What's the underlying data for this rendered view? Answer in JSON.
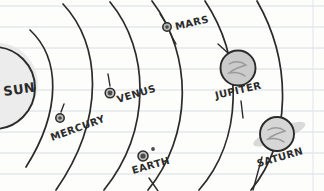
{
  "page": {
    "background_color": "#fdfdfc",
    "rule_line_color": "#d8dde2",
    "margin_line_color": "#dfe3e7",
    "ink_color": "#2b2b2b",
    "paper": {
      "rule_line_ys": [
        6,
        27,
        48,
        69,
        90,
        111,
        132,
        153,
        174
      ],
      "margin_line_x": 313
    }
  },
  "diagram": {
    "type": "solar-system-sketch",
    "sun": {
      "label": "SUN",
      "cx": -6,
      "cy": 88,
      "r": 41,
      "fill": "#ececec",
      "label_x": 4,
      "label_y": 96,
      "label_rotation": -8,
      "font_size": 13
    },
    "planets": [
      {
        "name": "MERCURY",
        "cx": 60,
        "cy": 118,
        "r": 4.2,
        "fill": "#b9b9b9",
        "label_x": 52,
        "label_y": 141,
        "label_rotation": -20,
        "font_size": 10,
        "has_ring": false,
        "has_moon": false
      },
      {
        "name": "VENUS",
        "cx": 110,
        "cy": 93,
        "r": 4.8,
        "fill": "#bdbdbd",
        "label_x": 118,
        "label_y": 103,
        "label_rotation": -17,
        "font_size": 10,
        "has_ring": false,
        "has_moon": false
      },
      {
        "name": "EARTH",
        "cx": 143,
        "cy": 156,
        "r": 5.0,
        "fill": "#c2c2c2",
        "label_x": 133,
        "label_y": 174,
        "label_rotation": -16,
        "font_size": 10,
        "has_ring": false,
        "has_moon": true,
        "moon_cx": 153,
        "moon_cy": 149,
        "moon_r": 1.9
      },
      {
        "name": "MARS",
        "cx": 167,
        "cy": 27,
        "r": 4.2,
        "fill": "#b5b5b5",
        "label_x": 176,
        "label_y": 30,
        "label_rotation": -13,
        "font_size": 10,
        "has_ring": false,
        "has_moon": false
      },
      {
        "name": "JUPITER",
        "cx": 238,
        "cy": 68,
        "r": 17.5,
        "fill": "#cbcbcb",
        "label_x": 216,
        "label_y": 99,
        "label_rotation": -13,
        "font_size": 10,
        "has_ring": false,
        "has_moon": false
      },
      {
        "name": "SATURN",
        "cx": 277,
        "cy": 134,
        "r": 17.0,
        "fill": "#d6d6d6",
        "label_x": 258,
        "label_y": 167,
        "label_rotation": -16,
        "font_size": 10,
        "has_ring": true,
        "ring_rx": 28,
        "ring_ry": 7,
        "ring_rotation": -22
      }
    ],
    "orbits": [
      {
        "name": "mercury-orbit",
        "d": "M 30 30 C 60 58, 62 110, 26 167"
      },
      {
        "name": "venus-orbit",
        "d": "M 63 4 C 101 44, 106 118, 56 190"
      },
      {
        "name": "earth-orbit",
        "d": "M 110 2 C 150 50, 152 130, 104 190"
      },
      {
        "name": "mars-orbit",
        "d": "M 152 1 C 194 56, 192 136, 148 190"
      },
      {
        "name": "jupiter-orbit",
        "d": "M 205 1 C 244 60, 243 140, 199 190"
      },
      {
        "name": "saturn-orbit",
        "d": "M 257 1 C 292 62, 292 140, 251 190"
      }
    ],
    "leader_lines": [
      {
        "name": "mars-leader-upper",
        "x1": 160,
        "y1": 14,
        "x2": 165,
        "y2": 22
      },
      {
        "name": "mars-leader-lower",
        "x1": 170,
        "y1": 33,
        "x2": 176,
        "y2": 44
      },
      {
        "name": "venus-leader",
        "x1": 108,
        "y1": 74,
        "x2": 110,
        "y2": 86
      },
      {
        "name": "mercury-leader",
        "x1": 64,
        "y1": 104,
        "x2": 61,
        "y2": 112
      },
      {
        "name": "earth-leader",
        "x1": 149,
        "y1": 178,
        "x2": 158,
        "y2": 191
      },
      {
        "name": "jupiter-leader",
        "x1": 218,
        "y1": 44,
        "x2": 228,
        "y2": 53
      },
      {
        "name": "jupiter-leader-2",
        "x1": 241,
        "y1": 101,
        "x2": 243,
        "y2": 118
      },
      {
        "name": "saturn-leader",
        "x1": 253,
        "y1": 190,
        "x2": 262,
        "y2": 157
      }
    ]
  }
}
